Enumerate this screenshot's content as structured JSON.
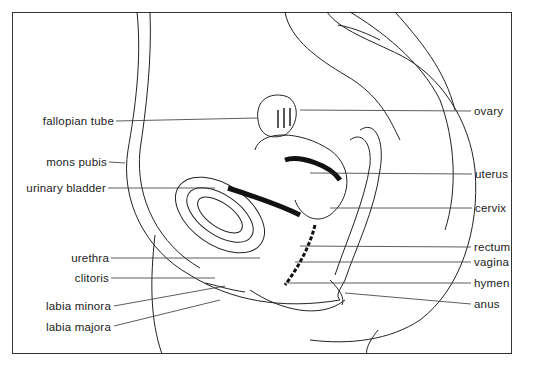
{
  "diagram": {
    "type": "anatomical cross-section",
    "left_labels": [
      {
        "id": "fallopian-tube",
        "text": "fallopian tube",
        "x": 116,
        "y": 121
      },
      {
        "id": "mons-pubis",
        "text": "mons pubis",
        "x": 108,
        "y": 162
      },
      {
        "id": "urinary-bladder",
        "text": "urinary bladder",
        "x": 107,
        "y": 188
      },
      {
        "id": "urethra",
        "text": "urethra",
        "x": 110,
        "y": 258
      },
      {
        "id": "clitoris",
        "text": "clitoris",
        "x": 110,
        "y": 278
      },
      {
        "id": "labia-minora",
        "text": "labia minora",
        "x": 112,
        "y": 306
      },
      {
        "id": "labia-majora",
        "text": "labia majora",
        "x": 112,
        "y": 327
      }
    ],
    "right_labels": [
      {
        "id": "ovary",
        "text": "ovary",
        "x": 473,
        "y": 111
      },
      {
        "id": "uterus",
        "text": "uterus",
        "x": 474,
        "y": 174
      },
      {
        "id": "cervix",
        "text": "cervix",
        "x": 474,
        "y": 208
      },
      {
        "id": "rectum",
        "text": "rectum",
        "x": 473,
        "y": 247
      },
      {
        "id": "vagina",
        "text": "vagina",
        "x": 473,
        "y": 262
      },
      {
        "id": "hymen",
        "text": "hymen",
        "x": 473,
        "y": 283
      },
      {
        "id": "anus",
        "text": "anus",
        "x": 473,
        "y": 304
      }
    ]
  }
}
